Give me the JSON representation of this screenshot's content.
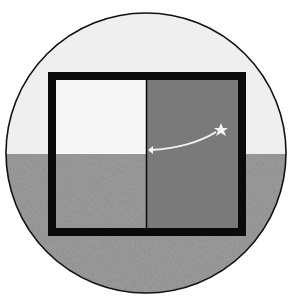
{
  "diagram": {
    "colors": {
      "background": "#ffffff",
      "sky": "#efefef",
      "sea": "#8c8c8c",
      "frame": "#0a0a0a",
      "shaded_panel": "#7a7a7a",
      "left_panel_sky": "#f7f7f7",
      "star_and_arrow": "#f4f4f4"
    },
    "elements": {
      "viewport_circle": {
        "cx": 146,
        "cy": 153,
        "r": 140
      },
      "horizon_y": 154,
      "frame": {
        "outer": [
          48,
          72,
          246,
          236
        ],
        "inner": [
          56,
          80,
          238,
          228
        ]
      },
      "divider_x": 146,
      "star": {
        "x": 221,
        "y": 130
      },
      "arrow_tip": {
        "x": 148,
        "y": 150
      }
    }
  }
}
